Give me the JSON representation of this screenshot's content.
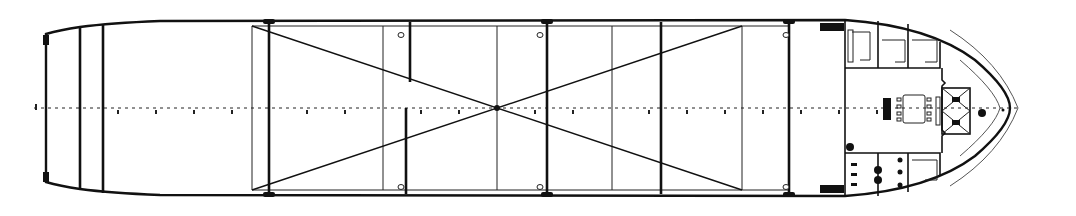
{
  "diagram": {
    "type": "ship-deck-plan",
    "view": "plan view (top-down), stern at left, bow at right",
    "colors": {
      "line": "#111111",
      "background": "#ffffff"
    },
    "hull": {
      "stern_x": 46,
      "bow_tip_x": 1010,
      "top_y": 20,
      "bottom_y": 196,
      "centerline_y": 108
    },
    "stern_section": {
      "transom_x": 46,
      "bulkheads_x": [
        80,
        103
      ]
    },
    "cargo_hold": {
      "start_x": 252,
      "end_x": 790,
      "main_bulkheads_x": [
        269,
        409,
        540,
        662,
        790
      ],
      "light_frames_x": [
        252,
        383,
        497,
        612,
        742
      ],
      "diagonal_cross": {
        "from": [
          [
            252,
            26
          ],
          [
            252,
            190
          ]
        ],
        "to": [
          [
            742,
            190
          ],
          [
            742,
            26
          ]
        ],
        "intersection_x": 497
      },
      "hatch_marks_x": [
        401,
        540,
        786
      ]
    },
    "accommodation": {
      "start_x": 845,
      "upper_rooms": 4,
      "lower_rooms": 4,
      "central_lounge": {
        "table": "dining table with chairs",
        "stair": "stairway"
      },
      "fwd_structure": "mooring / windlass box with cross-bracing"
    },
    "frame_ticks": {
      "count": 26,
      "spacing_px": 37.8
    },
    "labels": []
  }
}
